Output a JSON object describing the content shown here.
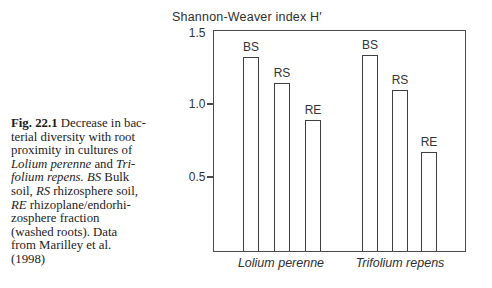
{
  "figure": {
    "caption_lines": [
      [
        {
          "t": "Fig. 22.1",
          "st": "b"
        },
        {
          "t": " Decrease in bac-",
          "st": "n"
        }
      ],
      [
        {
          "t": "terial diversity with root",
          "st": "n"
        }
      ],
      [
        {
          "t": "proximity in cultures of",
          "st": "n"
        }
      ],
      [
        {
          "t": "Lolium perenne",
          "st": "i"
        },
        {
          "t": " and ",
          "st": "n"
        },
        {
          "t": "Tri-",
          "st": "i"
        }
      ],
      [
        {
          "t": "folium repens.",
          "st": "i"
        },
        {
          "t": " ",
          "st": "n"
        },
        {
          "t": "BS",
          "st": "i"
        },
        {
          "t": " Bulk",
          "st": "n"
        }
      ],
      [
        {
          "t": "soil, ",
          "st": "n"
        },
        {
          "t": "RS",
          "st": "i"
        },
        {
          "t": " rhizosphere soil,",
          "st": "n"
        }
      ],
      [
        {
          "t": "RE",
          "st": "i"
        },
        {
          "t": " rhizoplane/endorhi-",
          "st": "n"
        }
      ],
      [
        {
          "t": "zosphere fraction",
          "st": "n"
        }
      ],
      [
        {
          "t": "(washed roots). Data",
          "st": "n"
        }
      ],
      [
        {
          "t": "from Marilley et al.",
          "st": "n"
        }
      ],
      [
        {
          "t": "(1998)",
          "st": "n"
        }
      ]
    ]
  },
  "chart_data": {
    "type": "bar",
    "title": "Shannon-Weaver index H′",
    "xlabel": "",
    "ylabel": "Shannon-Weaver index H′",
    "ylim": [
      0,
      1.5
    ],
    "grid": false,
    "legend": "none",
    "bar_fill": "#ffffff",
    "line_color": "#4a4a4a",
    "yticks": [
      {
        "value": 1.5,
        "label": "1.5",
        "tick_mark": false
      },
      {
        "value": 1.0,
        "label": "1.0",
        "tick_mark": true
      },
      {
        "value": 0.5,
        "label": "0.5",
        "tick_mark": true
      }
    ],
    "groups": [
      {
        "name": "Lolium perenne",
        "categories": [
          "BS",
          "RS",
          "RE"
        ],
        "values": [
          1.33,
          1.15,
          0.9
        ]
      },
      {
        "name": "Trifolium repens",
        "categories": [
          "BS",
          "RS",
          "RE"
        ],
        "values": [
          1.34,
          1.1,
          0.68
        ]
      }
    ],
    "layout": {
      "plot": {
        "left": 213,
        "top": 30,
        "width": 253,
        "height": 222
      },
      "bar_width": 16,
      "bar_x": [
        29,
        60,
        91,
        148,
        178,
        207
      ],
      "group_label_centers": [
        67,
        186
      ],
      "group_label_top_offset": 6
    }
  }
}
